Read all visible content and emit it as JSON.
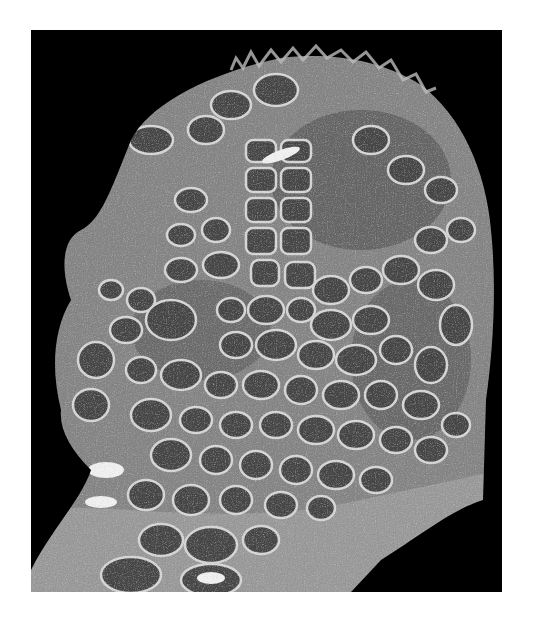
{
  "image": {
    "description": "Grayscale micrograph of a tissue section with many rounded follicle-like compartments separated by pale septa, on a black background",
    "background_color": "#000000",
    "page_color": "#ffffff",
    "tissue_colors": {
      "stroma": "#8a8a8a",
      "follicle": "#4a4a4a",
      "follicle_dark": "#333333",
      "septa": "#d8d8d8",
      "highlight": "#f2f2f2"
    }
  }
}
